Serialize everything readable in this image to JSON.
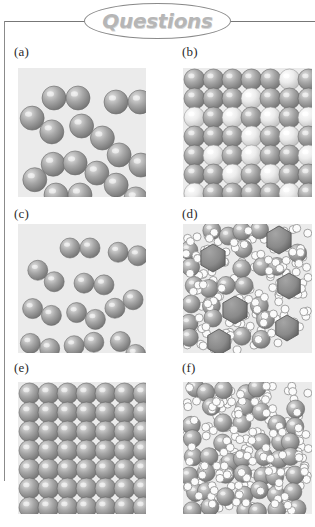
{
  "header": {
    "title": "Questions",
    "shape": "ellipse-banner",
    "rule_color": "#777777",
    "title_color": "#b6b6b6"
  },
  "page": {
    "background": "#ffffff",
    "panel_background": "#ebebeb",
    "label_color": "#2b2b2b",
    "width": 315,
    "height": 527
  },
  "palette": {
    "sphere_gray_light": "#e2e2e2",
    "sphere_gray_mid": "#a8a8a8",
    "sphere_gray_dark": "#6f6f6f",
    "sphere_white_light": "#ffffff",
    "sphere_white_mid": "#ececec",
    "sphere_white_dark": "#b9b9b9",
    "hexagon_fill": "#8a8a8a",
    "hexagon_stroke": "#5a5a5a",
    "small_circle_fill": "#fbfbfb",
    "small_circle_stroke": "#8e8e8e",
    "outline": "#6a6a6a"
  },
  "panels": [
    {
      "id": "a",
      "label": "(a)",
      "label_x": 14,
      "label_y": 50,
      "x": 18,
      "y": 68,
      "w": 128,
      "h": 129,
      "content": "diatomic-molecules-gas",
      "description": "Widely separated pairs of gray spheres representing diatomic molecules in a gas",
      "molecules": [
        {
          "x": 36,
          "y": 18,
          "angle": 0
        },
        {
          "x": 98,
          "y": 22,
          "angle": 0
        },
        {
          "x": 12,
          "y": 45,
          "angle": 35
        },
        {
          "x": 62,
          "y": 52,
          "angle": 30
        },
        {
          "x": 100,
          "y": 80,
          "angle": 25
        },
        {
          "x": 14,
          "y": 92,
          "angle": 140
        },
        {
          "x": 56,
          "y": 88,
          "angle": 25
        },
        {
          "x": 38,
          "y": 115,
          "angle": 0
        },
        {
          "x": 96,
          "y": 112,
          "angle": 35
        }
      ],
      "sphere_radius": 12
    },
    {
      "id": "b",
      "label": "(b)",
      "label_x": 182,
      "label_y": 50,
      "x": 183,
      "y": 68,
      "w": 129,
      "h": 129,
      "content": "two-component-crystalline-solid",
      "description": "Dense close-packed lattice mixing gray and white spheres (solid solution / alloy)",
      "lattice": {
        "cols": 7,
        "rows": 7,
        "spacing": 19,
        "radius": 10.5
      },
      "white_positions": [
        [
          5,
          0
        ],
        [
          3,
          1
        ],
        [
          0,
          2
        ],
        [
          2,
          2
        ],
        [
          4,
          2
        ],
        [
          6,
          2
        ],
        [
          3,
          3
        ],
        [
          5,
          3
        ],
        [
          1,
          4
        ],
        [
          3,
          4
        ],
        [
          6,
          4
        ],
        [
          2,
          5
        ],
        [
          4,
          5
        ],
        [
          0,
          6
        ],
        [
          5,
          6
        ]
      ]
    },
    {
      "id": "c",
      "label": "(c)",
      "label_x": 14,
      "label_y": 212,
      "x": 18,
      "y": 224,
      "w": 128,
      "h": 129,
      "content": "diatomic-molecules-gas-denser",
      "description": "Pairs of smaller gray spheres, more numerous than in (a)",
      "molecules": [
        {
          "x": 52,
          "y": 14,
          "angle": 0
        },
        {
          "x": 100,
          "y": 20,
          "angle": 10
        },
        {
          "x": 18,
          "y": 42,
          "angle": 35
        },
        {
          "x": 66,
          "y": 50,
          "angle": 5
        },
        {
          "x": 14,
          "y": 78,
          "angle": 20
        },
        {
          "x": 58,
          "y": 82,
          "angle": 20
        },
        {
          "x": 96,
          "y": 70,
          "angle": -25
        },
        {
          "x": 12,
          "y": 112,
          "angle": 15
        },
        {
          "x": 56,
          "y": 110,
          "angle": -10
        },
        {
          "x": 100,
          "y": 114,
          "angle": 40
        }
      ],
      "sphere_radius": 10
    },
    {
      "id": "d",
      "label": "(d)",
      "label_x": 182,
      "label_y": 212,
      "x": 183,
      "y": 224,
      "w": 129,
      "h": 129,
      "content": "mixture-spheres-hexagons-small-circles",
      "description": "Gray spheres and small white circles packed together with several darker gray hexagons dispersed through the mixture",
      "hexagons": [
        {
          "x": 30,
          "y": 34,
          "r": 14
        },
        {
          "x": 96,
          "y": 16,
          "r": 14
        },
        {
          "x": 106,
          "y": 62,
          "r": 13
        },
        {
          "x": 52,
          "y": 86,
          "r": 14
        },
        {
          "x": 104,
          "y": 104,
          "r": 13
        },
        {
          "x": 36,
          "y": 118,
          "r": 13
        }
      ],
      "sphere_radius": 9,
      "small_radius": 4
    },
    {
      "id": "e",
      "label": "(e)",
      "label_x": 14,
      "label_y": 366,
      "x": 18,
      "y": 382,
      "w": 128,
      "h": 132,
      "content": "pure-crystalline-solid",
      "description": "Uniform close-packed lattice of identical gray spheres",
      "lattice": {
        "cols": 7,
        "rows": 7,
        "spacing": 19,
        "radius": 10.5
      }
    },
    {
      "id": "f",
      "label": "(f)",
      "label_x": 182,
      "label_y": 366,
      "x": 183,
      "y": 382,
      "w": 129,
      "h": 132,
      "content": "liquid-mixture-spheres-and-small-circles",
      "description": "Gray spheres interspersed with small white circles, irregularly arranged like a liquid",
      "sphere_radius": 9,
      "small_radius": 4
    }
  ]
}
